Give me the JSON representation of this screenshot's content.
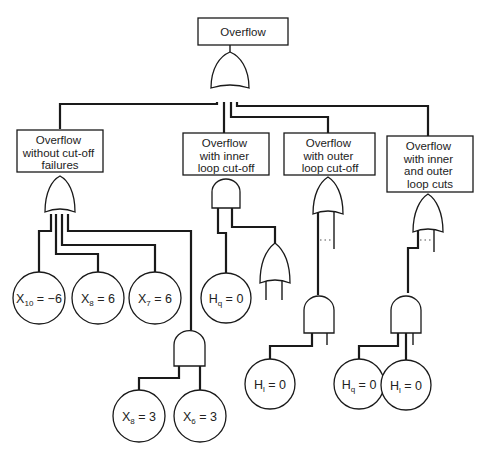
{
  "diagram": {
    "type": "fault-tree",
    "top_event": {
      "label": "Overflow",
      "gate": "OR"
    },
    "branches": [
      {
        "id": "without-cutoff",
        "lines": [
          "Overflow",
          "without cut-off",
          "failures"
        ],
        "gate": "OR",
        "children": [
          {
            "type": "basic-event",
            "var": "X",
            "sub": "10",
            "op": " = ",
            "value": "−6"
          },
          {
            "type": "basic-event",
            "var": "X",
            "sub": "8",
            "op": " = ",
            "value": "6"
          },
          {
            "type": "basic-event",
            "var": "X",
            "sub": "7",
            "op": " = ",
            "value": "6"
          },
          {
            "type": "gate",
            "gate": "AND",
            "children": [
              {
                "type": "basic-event",
                "var": "X",
                "sub": "8",
                "op": " = ",
                "value": "3"
              },
              {
                "type": "basic-event",
                "var": "X",
                "sub": "6",
                "op": " = ",
                "value": "3"
              }
            ]
          }
        ]
      },
      {
        "id": "inner-cutoff",
        "lines": [
          "Overflow",
          "with inner",
          "loop cut-off"
        ],
        "gate": "AND",
        "children": [
          {
            "type": "basic-event",
            "var": "H",
            "sub": "q",
            "op": " = ",
            "value": "0"
          },
          {
            "type": "gate",
            "gate": "OR",
            "children": []
          }
        ]
      },
      {
        "id": "outer-cutoff",
        "lines": [
          "Overflow",
          "with outer",
          "loop cut-off"
        ],
        "gate": "OR",
        "children": [
          {
            "type": "gate",
            "gate": "AND",
            "children": [
              {
                "type": "basic-event",
                "var": "H",
                "sub": "l",
                "op": " = ",
                "value": "0"
              }
            ]
          }
        ]
      },
      {
        "id": "inner-outer-cuts",
        "lines": [
          "Overflow",
          "with inner",
          "and outer",
          "loop cuts"
        ],
        "gate": "OR",
        "children": [
          {
            "type": "gate",
            "gate": "AND",
            "children": [
              {
                "type": "basic-event",
                "var": "H",
                "sub": "q",
                "op": " = ",
                "value": "0"
              },
              {
                "type": "basic-event",
                "var": "H",
                "sub": "l",
                "op": " = ",
                "value": "0"
              }
            ]
          }
        ]
      }
    ]
  }
}
